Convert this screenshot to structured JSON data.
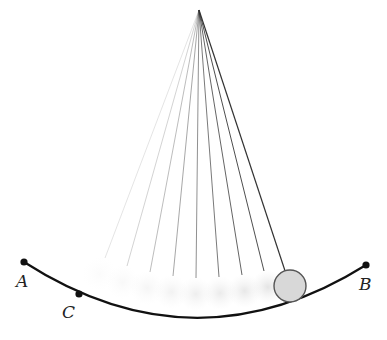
{
  "diagram": {
    "pivot": {
      "x": 199,
      "y": 10
    },
    "string_ends": [
      {
        "x": 105,
        "y": 258,
        "opacity": 0.12
      },
      {
        "x": 127,
        "y": 266,
        "opacity": 0.2
      },
      {
        "x": 150,
        "y": 272,
        "opacity": 0.3
      },
      {
        "x": 173,
        "y": 276,
        "opacity": 0.4
      },
      {
        "x": 196,
        "y": 278,
        "opacity": 0.5
      },
      {
        "x": 219,
        "y": 277,
        "opacity": 0.6
      },
      {
        "x": 242,
        "y": 275,
        "opacity": 0.7
      },
      {
        "x": 264,
        "y": 271,
        "opacity": 0.8
      }
    ],
    "bob": {
      "x": 290,
      "y": 286,
      "r": 16,
      "fill": "#d8d8d8",
      "stroke": "#555555"
    },
    "arc": {
      "start": {
        "x": 24,
        "y": 262
      },
      "control": {
        "x": 195,
        "y": 372
      },
      "end": {
        "x": 366,
        "y": 265
      }
    },
    "points": [
      {
        "name": "A",
        "x": 24,
        "y": 262,
        "label_x": 16,
        "label_y": 287
      },
      {
        "name": "C",
        "x": 79,
        "y": 294,
        "label_x": 62,
        "label_y": 318
      },
      {
        "name": "B",
        "x": 366,
        "y": 265,
        "label_x": 359,
        "label_y": 290
      }
    ],
    "labels": {
      "A": "A",
      "B": "B",
      "C": "C"
    }
  }
}
